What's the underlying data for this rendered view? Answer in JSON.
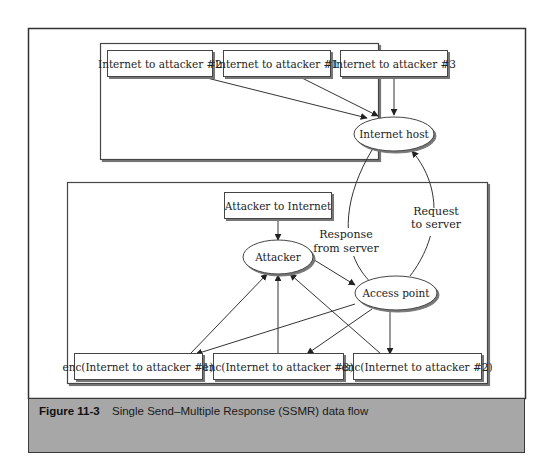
{
  "figure": {
    "label": "Figure 11-3",
    "caption": "Single Send–Multiple Response (SSMR) data flow"
  },
  "groups": {
    "internet_side": {
      "name": "internet-group"
    },
    "wireless_side": {
      "name": "wireless-group"
    }
  },
  "nodes": {
    "inet_att2": {
      "label": "Internet to attacker #2",
      "shape": "rect"
    },
    "inet_att1": {
      "label": "Internet to attacker #1",
      "shape": "rect"
    },
    "inet_att3": {
      "label": "Internet to attacker #3",
      "shape": "rect"
    },
    "internet_host": {
      "label": "Internet host",
      "shape": "ellipse"
    },
    "attacker_to_internet": {
      "label": "Attacker to Internet",
      "shape": "rect"
    },
    "attacker": {
      "label": "Attacker",
      "shape": "ellipse"
    },
    "access_point": {
      "label": "Access point",
      "shape": "ellipse"
    },
    "enc_att1": {
      "label": "enc(Internet to attacker #1)",
      "shape": "rect"
    },
    "enc_att3": {
      "label": "enc(Internet to attacker #3)",
      "shape": "rect"
    },
    "enc_att2": {
      "label": "enc(Internet to attacker #2)",
      "shape": "rect"
    }
  },
  "edge_labels": {
    "response_line1": "Response",
    "response_line2": "from server",
    "request_line1": "Request",
    "request_line2": "to server"
  },
  "edges": [
    {
      "from": "Internet to attacker #2",
      "to": "Internet host"
    },
    {
      "from": "Internet to attacker #1",
      "to": "Internet host"
    },
    {
      "from": "Internet to attacker #3",
      "to": "Internet host"
    },
    {
      "from": "Internet host",
      "to": "Access point",
      "label": "Response from server"
    },
    {
      "from": "Access point",
      "to": "Internet host",
      "label": "Request to server"
    },
    {
      "from": "Attacker to Internet",
      "to": "Attacker"
    },
    {
      "from": "Attacker",
      "to": "Access point"
    },
    {
      "from": "Access point",
      "to": "enc(Internet to attacker #1)"
    },
    {
      "from": "Access point",
      "to": "enc(Internet to attacker #3)"
    },
    {
      "from": "Access point",
      "to": "enc(Internet to attacker #2)"
    },
    {
      "from": "enc(Internet to attacker #1)",
      "to": "Attacker"
    },
    {
      "from": "enc(Internet to attacker #3)",
      "to": "Attacker"
    },
    {
      "from": "enc(Internet to attacker #2)",
      "to": "Attacker"
    }
  ],
  "colors": {
    "stroke": "#333333",
    "caption_bg": "#a7a7a7",
    "background": "#ffffff"
  }
}
